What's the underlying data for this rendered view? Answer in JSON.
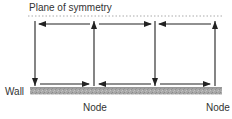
{
  "diagram": {
    "title_label": "Plane of symmetry",
    "wall_label": "Wall",
    "node_labels": [
      "Node",
      "Node"
    ],
    "colors": {
      "line": "#222222",
      "dotted": "#aaaaaa",
      "ground": "#9a9a9a",
      "text": "#333333"
    },
    "cells": [
      {
        "left_x": 35,
        "right_x": 94,
        "top_arrow": "left",
        "left_side": "down",
        "bottom_arrow": "right",
        "right_side": "up"
      },
      {
        "left_x": 94,
        "right_x": 155,
        "top_arrow": "right",
        "bottom_arrow": "left"
      },
      {
        "left_x": 155,
        "right_x": 215,
        "top_arrow": "left",
        "left_side": "down",
        "bottom_arrow": "right",
        "right_side": "up"
      }
    ]
  }
}
